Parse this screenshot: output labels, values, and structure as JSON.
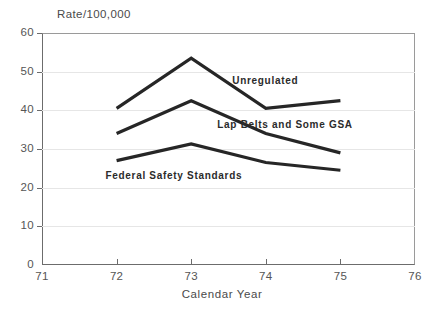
{
  "chart_data": {
    "type": "line",
    "title": "",
    "ylabel": "Rate/100,000",
    "xlabel": "Calendar Year",
    "x": [
      1972,
      1973,
      1974,
      1975
    ],
    "xlim": [
      1971,
      1976
    ],
    "ylim": [
      0,
      60
    ],
    "xticks": [
      "71",
      "72",
      "73",
      "74",
      "75",
      "76"
    ],
    "yticks": [
      "0",
      "10",
      "20",
      "30",
      "40",
      "50",
      "60"
    ],
    "grid": "horizontal",
    "legend_position": "inline-annotations",
    "line_color": "#262626",
    "series": [
      {
        "name": "Unregulated",
        "values": [
          40.5,
          53.5,
          40.5,
          42.5
        ],
        "label_x": 1973.55,
        "label_y": 47.5
      },
      {
        "name": "Lap Belts and Some GSA",
        "values": [
          34.0,
          42.5,
          34.0,
          29.0
        ],
        "label_x": 1973.35,
        "label_y": 36.2
      },
      {
        "name": "Federal Safety Standards",
        "values": [
          27.0,
          31.3,
          26.5,
          24.5
        ],
        "label_x": 1971.85,
        "label_y": 23.0
      }
    ]
  }
}
